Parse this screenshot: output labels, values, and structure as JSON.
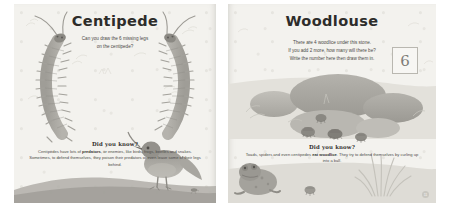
{
  "spread": {
    "left_page": {
      "title": "Centipede",
      "instruction": "Can you draw the 6 missing legs\non the centipede?",
      "did_you_know": {
        "heading": "Did you know?",
        "text_before": "Centipedes have lots of ",
        "bold": "predators",
        "text_after": ", or enemies, like birds, frogs, beetles and snakes. Sometimes, to defend themselves, they poison their predators or even leave some of their legs behind."
      },
      "illustrations": [
        "centipede-left",
        "centipede-right",
        "bird",
        "ground-mound"
      ]
    },
    "right_page": {
      "title": "Woodlouse",
      "instruction": "There are 4 woodlice under this stone.\nIf you add 2 more, how many will there be?\nWrite the number here then draw them in.",
      "answer": "6",
      "did_you_know": {
        "heading": "Did you know?",
        "text_before": "Toads, spiders and even centipedes ",
        "bold": "eat woodlice",
        "text_after": ". They try to defend themselves by curling up into a ball."
      },
      "page_number": "11",
      "illustrations": [
        "stones",
        "woodlice",
        "toad",
        "grass-tuft"
      ]
    }
  },
  "colors": {
    "paper": "#f3f2ee",
    "ink": "#2d2c2a",
    "body_text": "#4d4c49",
    "illustration_grey": "#a9a7a1",
    "illustration_dark": "#8e8c86",
    "box_border": "#b9b7b0"
  }
}
